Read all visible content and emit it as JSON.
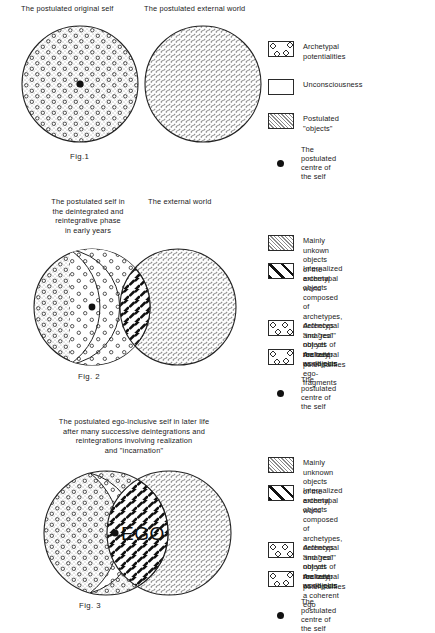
{
  "figures": [
    {
      "id": "fig1",
      "caption": "Fig.1",
      "headings": [
        "The postulated original self",
        "The postulated external world"
      ],
      "legend": [
        {
          "swatch": "archetypal-potentialities",
          "text": "Archetypal potentialities"
        },
        {
          "swatch": "unconsciousness",
          "text": "Unconsciousness"
        },
        {
          "swatch": "postulated-objects",
          "text": "Postulated \"objects\""
        }
      ],
      "centre_note": "The postulated centre of the self"
    },
    {
      "id": "fig2",
      "caption": "Fig. 2",
      "headings": [
        "The postulated self in\nthe deintegrated and\nreintegrative phase\nin early years",
        "The external world"
      ],
      "legend": [
        {
          "swatch": "external-world-objects",
          "text": "Mainly unkown objects of the\nexternal world"
        },
        {
          "swatch": "internalized-archetypal-objects",
          "text": "Internalized archetypal objects\ncomposed of archetypes, defences\nand \"real\" objects of the outer\nworld plus ego-fragments"
        },
        {
          "swatch": "archetypal-images",
          "text": "Archetypal \"images\" not yet\nrealized as objects"
        },
        {
          "swatch": "archetypal-potentialities",
          "text": "Archetypal potentialities"
        }
      ],
      "centre_note": "The postulated centre of the self"
    },
    {
      "id": "fig3",
      "caption": "Fig. 3",
      "headings": [
        "The postulated ego-inclusive self in later life\nafter many successive deintegrations and\nreintegrations involving  realization\nand \"incarnation\""
      ],
      "ego_label": "EGO",
      "legend": [
        {
          "swatch": "external-world-objects",
          "text": "Mainly unknown objects of the\nexternal world"
        },
        {
          "swatch": "internalized-archetypal-objects",
          "text": "Internalized archetypal objects\ncomposed of archetypes, defences\nand \"real\" objects of the outer\nworld plus a coherent ego"
        },
        {
          "swatch": "archetypal-images",
          "text": "Archetypal \"images\" not yet\nrealized as objects"
        },
        {
          "swatch": "archetypal-potentialities",
          "text": "Archetypal potentialities"
        }
      ],
      "centre_note": "The postulated centre of the self"
    }
  ],
  "colors": {
    "ink": "#1a1a1a",
    "stipple": "#8c8c8c",
    "hatch": "#8a8a8a",
    "dark_dash": "#121212",
    "background": "#ffffff"
  }
}
